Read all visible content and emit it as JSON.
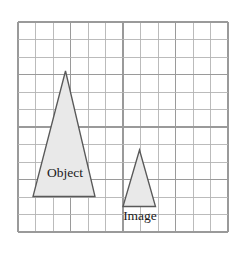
{
  "figure": {
    "type": "optics-ray-diagram-grid",
    "background_color": "#ffffff"
  },
  "grid": {
    "name": "square-grid",
    "columns": 12,
    "rows": 12,
    "cell_size_px": 17.5,
    "origin_x_px": 18,
    "origin_y_px": 22,
    "line_color": "#b4b4b4",
    "major_line_color": "#9a9a9a",
    "major_every": 3
  },
  "shapes": [
    {
      "name": "object-triangle",
      "label": "Object",
      "fill_color": "#e9e9e9",
      "stroke_color": "#595959",
      "apex": {
        "x": 65.5,
        "y": 71
      },
      "base_left": {
        "x": 33,
        "y": 196.5
      },
      "base_right": {
        "x": 95,
        "y": 196.5
      },
      "label_x": 65,
      "label_y": 177
    },
    {
      "name": "image-triangle",
      "label": "Image",
      "fill_color": "#e9e9e9",
      "stroke_color": "#595959",
      "apex": {
        "x": 139.5,
        "y": 150
      },
      "base_left": {
        "x": 123,
        "y": 206.5
      },
      "base_right": {
        "x": 155.5,
        "y": 206.5
      },
      "label_x": 140,
      "label_y": 220
    }
  ]
}
